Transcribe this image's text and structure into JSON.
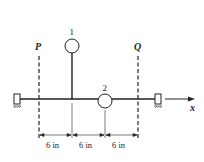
{
  "diagram": {
    "mass_labels": [
      "1",
      "2"
    ],
    "planes": [
      "P",
      "Q"
    ],
    "axis_label": "x",
    "dimensions": [
      "6 in",
      "6 in",
      "6 in"
    ],
    "colors": {
      "line": "#222222",
      "background": "#ffffff"
    }
  }
}
